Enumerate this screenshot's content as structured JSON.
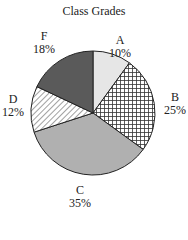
{
  "chart_data": {
    "type": "pie",
    "title": "Class Grades",
    "categories": [
      "A",
      "B",
      "C",
      "D",
      "F"
    ],
    "values": [
      10,
      25,
      35,
      12,
      18
    ],
    "value_labels": [
      "10%",
      "25%",
      "35%",
      "12%",
      "18%"
    ],
    "start_angle": "12 o'clock",
    "direction": "clockwise",
    "fills": [
      {
        "category": "A",
        "style": "solid",
        "color": "#e6e6e6"
      },
      {
        "category": "B",
        "style": "crosshatch",
        "color": "#ffffff",
        "line_color": "#333333"
      },
      {
        "category": "C",
        "style": "solid",
        "color": "#b0b0b0"
      },
      {
        "category": "D",
        "style": "diagonal-hatch",
        "color": "#ffffff",
        "line_color": "#444444"
      },
      {
        "category": "F",
        "style": "solid",
        "color": "#5a5a5a"
      }
    ],
    "legend": "none (labels placed outside slices)"
  },
  "labels": [
    {
      "name": "A",
      "pct": "10%"
    },
    {
      "name": "B",
      "pct": "25%"
    },
    {
      "name": "C",
      "pct": "35%"
    },
    {
      "name": "D",
      "pct": "12%"
    },
    {
      "name": "F",
      "pct": "18%"
    }
  ]
}
